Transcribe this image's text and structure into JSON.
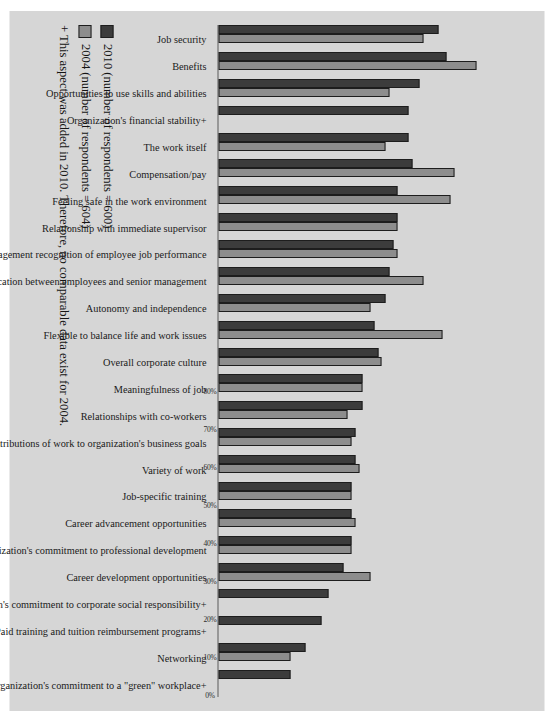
{
  "chart_data": {
    "type": "bar",
    "title": "",
    "xlabel": "",
    "ylabel": "",
    "ylim": [
      0,
      80
    ],
    "grid": false,
    "legend_position": "bottom-left",
    "tick_labels": [
      "0%",
      "10%",
      "20%",
      "30%",
      "40%",
      "50%",
      "60%",
      "70%",
      "80%"
    ],
    "tick_values": [
      0,
      10,
      20,
      30,
      40,
      50,
      60,
      70,
      80
    ],
    "categories": [
      "Job security",
      "Benefits",
      "Opportunities to use skills and abilities",
      "Organization's financial stability+",
      "The work itself",
      "Compensation/pay",
      "Feeling safe in the work environment",
      "Relationship with immediate supervisor",
      "Management recognition of employee job performance",
      "Communication between employees and senior management",
      "Autonomy and independence",
      "Flexible to balance life and work issues",
      "Overall corporate culture",
      "Meaningfulness of job",
      "Relationships with co-workers",
      "Contributions of work to organization's business goals",
      "Variety of work",
      "Job-specific training",
      "Career advancement opportunities",
      "Organization's commitment to professional development",
      "Career development opportunities",
      "Organization's commitment to corporate social responsibility+",
      "Paid training and tuition reimbursement programs+",
      "Networking",
      "Organization's commitment to a \"green\" workplace+"
    ],
    "series": [
      {
        "name": "2010 (number of respondents = 600)",
        "color": "#3c3c3c",
        "values": [
          58,
          60,
          53,
          50,
          50,
          51,
          47,
          47,
          46,
          45,
          44,
          41,
          42,
          38,
          38,
          36,
          36,
          35,
          35,
          35,
          33,
          29,
          27,
          23,
          19
        ]
      },
      {
        "name": "2004 (number of respondents = 604)",
        "color": "#8d8d8d",
        "values": [
          54,
          68,
          45,
          null,
          44,
          62,
          61,
          47,
          47,
          54,
          40,
          59,
          43,
          38,
          34,
          35,
          37,
          35,
          36,
          35,
          40,
          null,
          null,
          19,
          null
        ]
      }
    ],
    "footnote": "+ This aspect was added in 2010. Therefore, no comparable data exist for 2004."
  },
  "legend": {
    "items": [
      {
        "label": "2010 (number of respondents = 600)",
        "swatch": "s2010"
      },
      {
        "label": "2004 (number of respondents = 604)",
        "swatch": "s2004"
      }
    ],
    "footnote": "+ This aspect was added in 2010. Therefore, no comparable data exist for 2004."
  }
}
